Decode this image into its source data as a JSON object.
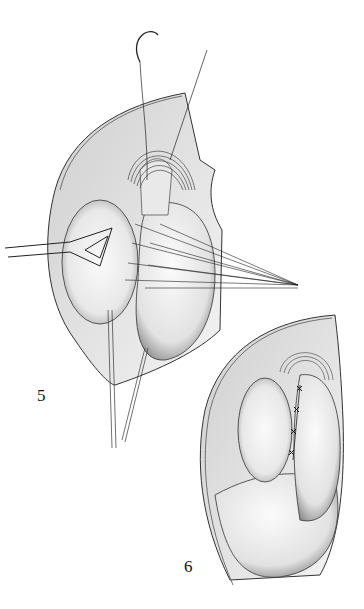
{
  "figures": [
    {
      "id": "fig5",
      "label": "5",
      "description": "Suture placement with retractor and multiple sutures fanned to the right"
    },
    {
      "id": "fig6",
      "label": "6",
      "description": "Completed closure with interrupted sutures along the seam"
    }
  ],
  "colors": {
    "ink": "#1a1a1a",
    "shade": "#bdbdbd",
    "light": "#e6e6e6",
    "background": "#ffffff"
  }
}
